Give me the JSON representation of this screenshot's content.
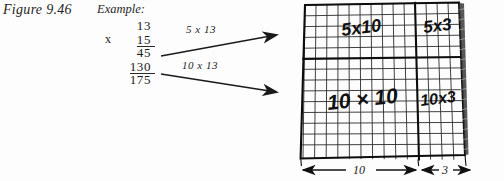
{
  "figure": {
    "caption": "Figure 9.46",
    "example_label": "Example:"
  },
  "long_multiplication": {
    "multiplicand": "13",
    "operator": "x",
    "multiplier": "15",
    "partial_product_1": "45",
    "partial_product_2": "130",
    "total": "175"
  },
  "arrows": [
    {
      "label": "5 x 13",
      "name": "arrow-5x13"
    },
    {
      "label": "10 x 13",
      "name": "arrow-10x13"
    }
  ],
  "grid": {
    "quadrant_labels": {
      "top_left": "5x10",
      "top_right": "5x3",
      "bottom_left": "10 × 10",
      "bottom_right": "10x3"
    },
    "dimensions": {
      "width_major": "10",
      "width_minor": "3"
    },
    "columns_major": 10,
    "columns_minor": 3,
    "rows_top": 5,
    "rows_bottom": 10,
    "ink_color": "#111111"
  },
  "colors": {
    "background": "#fdfdfd",
    "ink": "#1a1a1a",
    "grid_line": "#2b2b2b",
    "grid_heavy": "#0d0d0d"
  }
}
